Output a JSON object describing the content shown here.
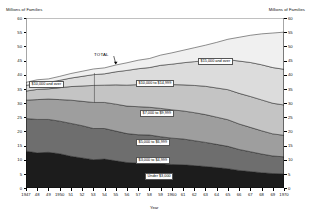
{
  "header": {
    "left_axis_title": "Millions of Families",
    "right_axis_title": "Millions of Families"
  },
  "annotations": {
    "total_label": "TOTAL",
    "left_band_callout": "$10,000 and over"
  },
  "chart_data": {
    "type": "area",
    "title": "",
    "xlabel": "Year",
    "ylabel": "Millions of Families",
    "ylim": [
      0,
      60
    ],
    "xlim": [
      1947,
      1970
    ],
    "grid": false,
    "legend_position": "inline-bands",
    "stacked": true,
    "x": [
      1947,
      1948,
      1949,
      1950,
      1951,
      1952,
      1953,
      1954,
      1955,
      1956,
      1957,
      1958,
      1959,
      1960,
      1961,
      1962,
      1963,
      1964,
      1965,
      1966,
      1967,
      1968,
      1969,
      1970
    ],
    "xtick_labels": [
      "1947",
      "48",
      "49",
      "1950",
      "51",
      "52",
      "53",
      "54",
      "55",
      "56",
      "57",
      "58",
      "59",
      "1960",
      "61",
      "62",
      "63",
      "64",
      "65",
      "66",
      "67",
      "68",
      "69",
      "1970"
    ],
    "ytick_labels": [
      "0",
      "5",
      "10",
      "15",
      "20",
      "25",
      "30",
      "35",
      "40",
      "45",
      "50",
      "55",
      "60"
    ],
    "yticks": [
      0,
      5,
      10,
      15,
      20,
      25,
      30,
      35,
      40,
      45,
      50,
      55,
      60
    ],
    "series": [
      {
        "name": "Under $3,000",
        "color": "#1c1c1c",
        "values": [
          13.0,
          12.4,
          12.6,
          12.1,
          11.2,
          10.6,
          10.0,
          10.2,
          9.6,
          9.0,
          8.8,
          8.9,
          8.6,
          8.3,
          8.2,
          7.9,
          7.6,
          7.2,
          6.8,
          6.2,
          5.8,
          5.4,
          5.1,
          5.0
        ]
      },
      {
        "name": "$3,000 to $4,999",
        "color": "#6e6e6e",
        "values": [
          11.5,
          11.8,
          11.6,
          11.5,
          11.6,
          11.4,
          11.0,
          10.8,
          10.5,
          10.2,
          10.0,
          9.8,
          9.5,
          9.3,
          9.1,
          8.8,
          8.5,
          8.2,
          7.9,
          7.4,
          7.0,
          6.6,
          6.2,
          6.0
        ]
      },
      {
        "name": "$5,000 to $6,999",
        "color": "#9e9e9e",
        "values": [
          6.5,
          7.0,
          7.2,
          7.6,
          8.2,
          8.6,
          9.2,
          9.2,
          9.5,
          9.7,
          9.9,
          9.8,
          10.0,
          10.0,
          9.9,
          9.9,
          9.8,
          9.6,
          9.4,
          9.0,
          8.6,
          8.2,
          7.8,
          7.6
        ]
      },
      {
        "name": "$7,000 to $9,999",
        "color": "#c4c4c4",
        "values": [
          3.2,
          3.6,
          3.6,
          4.2,
          4.8,
          5.4,
          6.0,
          6.1,
          6.8,
          7.4,
          7.8,
          8.0,
          8.6,
          8.9,
          9.2,
          9.6,
          10.0,
          10.3,
          10.6,
          10.8,
          10.9,
          10.9,
          10.8,
          10.7
        ]
      },
      {
        "name": "$10,000 to $14,999",
        "color": "#dcdcdc",
        "values": [
          2.0,
          2.2,
          2.3,
          2.6,
          3.0,
          3.4,
          3.8,
          4.0,
          4.6,
          5.2,
          5.6,
          6.0,
          6.6,
          7.2,
          7.8,
          8.4,
          9.0,
          9.8,
          10.6,
          11.4,
          12.0,
          12.4,
          12.6,
          12.6
        ]
      },
      {
        "name": "$15,000 and over",
        "color": "#f0f0f0",
        "values": [
          1.1,
          1.2,
          1.2,
          1.4,
          1.6,
          1.8,
          2.0,
          2.1,
          2.4,
          2.7,
          3.0,
          3.2,
          3.6,
          4.0,
          4.4,
          4.9,
          5.5,
          6.3,
          7.2,
          8.4,
          9.6,
          10.9,
          12.2,
          13.1
        ]
      }
    ],
    "band_labels": [
      {
        "text": "$15,000 and over",
        "x": 198,
        "y": 58
      },
      {
        "text": "$10,000 to $14,999",
        "x": 136,
        "y": 80
      },
      {
        "text": "$7,000 to $9,999",
        "x": 140,
        "y": 110
      },
      {
        "text": "$5,000 to $6,999",
        "x": 136,
        "y": 139
      },
      {
        "text": "$3,000 to $4,999",
        "x": 136,
        "y": 157
      },
      {
        "text": "Under $3,000",
        "x": 145,
        "y": 173
      }
    ],
    "total_values": [
      37.3,
      38.2,
      38.5,
      39.4,
      40.4,
      41.2,
      42.0,
      42.4,
      43.4,
      44.2,
      45.1,
      45.7,
      46.9,
      47.7,
      48.6,
      49.5,
      50.4,
      51.4,
      52.5,
      53.2,
      53.9,
      54.4,
      54.7,
      55.0
    ]
  }
}
